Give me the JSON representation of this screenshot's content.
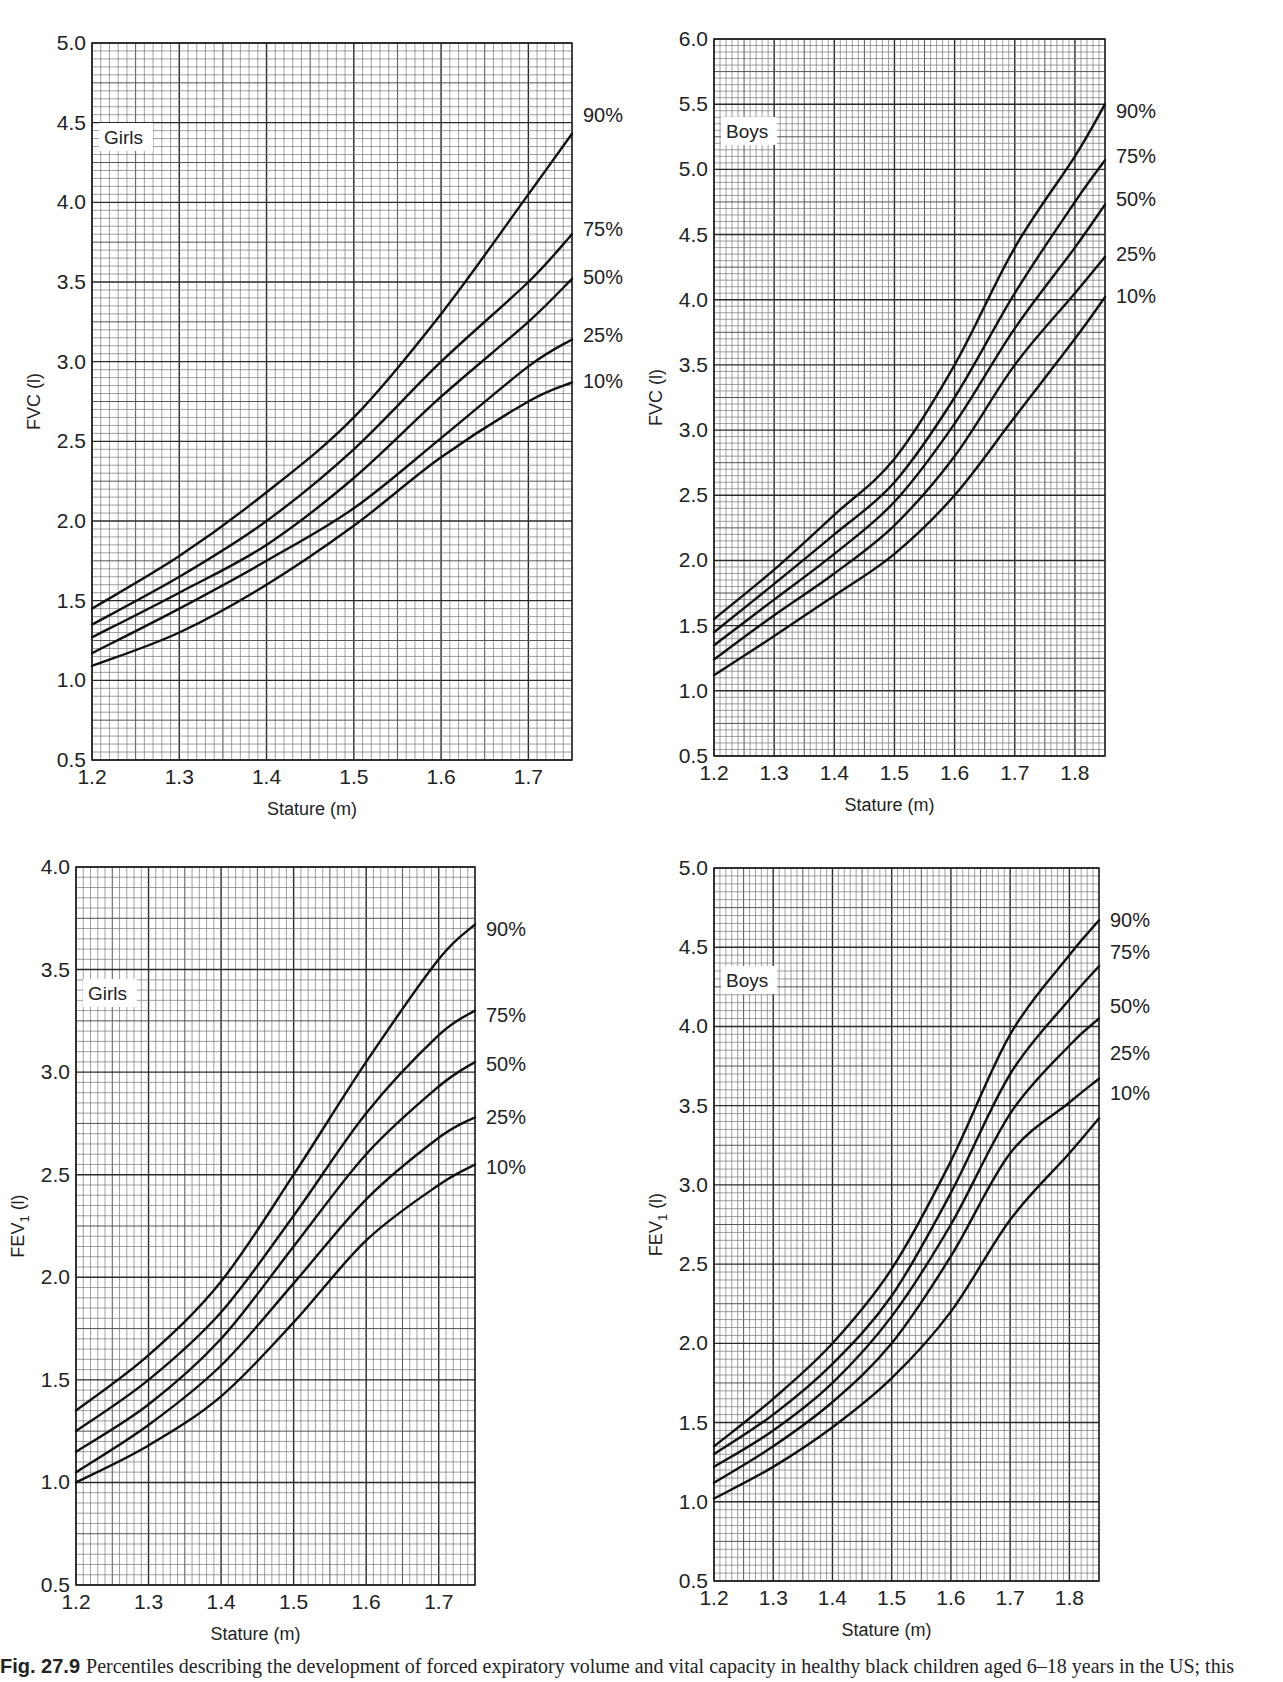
{
  "caption": {
    "fig_label": "Fig. 27.9",
    "text": "Percentiles describing the development of forced expiratory volume and vital capacity in healthy black children aged 6–18 years in the US; this"
  },
  "chart_data": [
    {
      "id": "girls-fvc",
      "type": "line",
      "panel_label": "Girls",
      "title": "",
      "xlabel": "Stature (m)",
      "ylabel": "FVC (l)",
      "xlim": [
        1.2,
        1.75
      ],
      "ylim": [
        0.5,
        5.0
      ],
      "xticks": [
        "1.2",
        "1.3",
        "1.4",
        "1.5",
        "1.6",
        "1.7"
      ],
      "yticks": [
        "0.5",
        "1.0",
        "1.5",
        "2.0",
        "2.5",
        "3.0",
        "3.5",
        "4.0",
        "4.5",
        "5.0"
      ],
      "grid": true,
      "legend_position": "right-edge labels",
      "x": [
        1.2,
        1.3,
        1.4,
        1.5,
        1.6,
        1.7,
        1.75
      ],
      "series": [
        {
          "name": "90%",
          "values": [
            1.45,
            1.78,
            2.18,
            2.65,
            3.3,
            4.05,
            4.43
          ],
          "label_y": 4.55
        },
        {
          "name": "75%",
          "values": [
            1.35,
            1.65,
            2.0,
            2.45,
            3.0,
            3.5,
            3.8
          ],
          "label_y": 3.83
        },
        {
          "name": "50%",
          "values": [
            1.27,
            1.55,
            1.85,
            2.27,
            2.78,
            3.25,
            3.52
          ],
          "label_y": 3.53
        },
        {
          "name": "25%",
          "values": [
            1.17,
            1.45,
            1.75,
            2.08,
            2.52,
            2.97,
            3.14
          ],
          "label_y": 3.17
        },
        {
          "name": "10%",
          "values": [
            1.09,
            1.3,
            1.6,
            1.97,
            2.4,
            2.75,
            2.87
          ],
          "label_y": 2.88
        }
      ]
    },
    {
      "id": "boys-fvc",
      "type": "line",
      "panel_label": "Boys",
      "title": "",
      "xlabel": "Stature (m)",
      "ylabel": "FVC (l)",
      "xlim": [
        1.2,
        1.85
      ],
      "ylim": [
        0.5,
        6.0
      ],
      "xticks": [
        "1.2",
        "1.3",
        "1.4",
        "1.5",
        "1.6",
        "1.7",
        "1.8"
      ],
      "yticks": [
        "0.5",
        "1.0",
        "1.5",
        "2.0",
        "2.5",
        "3.0",
        "3.5",
        "4.0",
        "4.5",
        "5.0",
        "5.5",
        "6.0"
      ],
      "grid": true,
      "legend_position": "right-edge labels",
      "x": [
        1.2,
        1.3,
        1.4,
        1.5,
        1.6,
        1.7,
        1.8,
        1.85
      ],
      "series": [
        {
          "name": "90%",
          "values": [
            1.55,
            1.93,
            2.35,
            2.78,
            3.5,
            4.4,
            5.1,
            5.5
          ],
          "label_y": 5.45
        },
        {
          "name": "75%",
          "values": [
            1.45,
            1.82,
            2.2,
            2.6,
            3.25,
            4.05,
            4.75,
            5.07
          ],
          "label_y": 5.1
        },
        {
          "name": "50%",
          "values": [
            1.35,
            1.7,
            2.05,
            2.45,
            3.05,
            3.78,
            4.4,
            4.73
          ],
          "label_y": 4.77
        },
        {
          "name": "25%",
          "values": [
            1.24,
            1.58,
            1.9,
            2.27,
            2.8,
            3.5,
            4.05,
            4.33
          ],
          "label_y": 4.35
        },
        {
          "name": "10%",
          "values": [
            1.12,
            1.42,
            1.73,
            2.05,
            2.5,
            3.1,
            3.7,
            4.02
          ],
          "label_y": 4.03
        }
      ]
    },
    {
      "id": "girls-fev1",
      "type": "line",
      "panel_label": "Girls",
      "title": "",
      "xlabel": "Stature (m)",
      "ylabel": "FEV1 (l)",
      "xlim": [
        1.2,
        1.75
      ],
      "ylim": [
        0.5,
        4.0
      ],
      "xticks": [
        "1.2",
        "1.3",
        "1.4",
        "1.5",
        "1.6",
        "1.7"
      ],
      "yticks": [
        "0.5",
        "1.0",
        "1.5",
        "2.0",
        "2.5",
        "3.0",
        "3.5",
        "4.0"
      ],
      "grid": true,
      "legend_position": "right-edge labels",
      "x": [
        1.2,
        1.3,
        1.4,
        1.5,
        1.6,
        1.7,
        1.75
      ],
      "series": [
        {
          "name": "90%",
          "values": [
            1.35,
            1.62,
            1.98,
            2.5,
            3.05,
            3.55,
            3.72
          ],
          "label_y": 3.7
        },
        {
          "name": "75%",
          "values": [
            1.25,
            1.5,
            1.83,
            2.3,
            2.8,
            3.18,
            3.3
          ],
          "label_y": 3.28
        },
        {
          "name": "50%",
          "values": [
            1.15,
            1.38,
            1.7,
            2.15,
            2.6,
            2.93,
            3.05
          ],
          "label_y": 3.04
        },
        {
          "name": "25%",
          "values": [
            1.05,
            1.28,
            1.57,
            1.97,
            2.38,
            2.68,
            2.78
          ],
          "label_y": 2.78
        },
        {
          "name": "10%",
          "values": [
            1.0,
            1.18,
            1.42,
            1.78,
            2.18,
            2.45,
            2.55
          ],
          "label_y": 2.54
        }
      ]
    },
    {
      "id": "boys-fev1",
      "type": "line",
      "panel_label": "Boys",
      "title": "",
      "xlabel": "Stature (m)",
      "ylabel": "FEV1 (l)",
      "xlim": [
        1.2,
        1.85
      ],
      "ylim": [
        0.5,
        5.0
      ],
      "xticks": [
        "1.2",
        "1.3",
        "1.4",
        "1.5",
        "1.6",
        "1.7",
        "1.8"
      ],
      "yticks": [
        "0.5",
        "1.0",
        "1.5",
        "2.0",
        "2.5",
        "3.0",
        "3.5",
        "4.0",
        "4.5",
        "5.0"
      ],
      "grid": true,
      "legend_position": "right-edge labels",
      "x": [
        1.2,
        1.3,
        1.4,
        1.5,
        1.6,
        1.7,
        1.8,
        1.85
      ],
      "series": [
        {
          "name": "90%",
          "values": [
            1.35,
            1.65,
            2.0,
            2.47,
            3.15,
            3.95,
            4.45,
            4.67
          ],
          "label_y": 4.67
        },
        {
          "name": "75%",
          "values": [
            1.3,
            1.55,
            1.87,
            2.3,
            2.95,
            3.7,
            4.17,
            4.38
          ],
          "label_y": 4.47
        },
        {
          "name": "50%",
          "values": [
            1.22,
            1.45,
            1.75,
            2.17,
            2.75,
            3.45,
            3.88,
            4.05
          ],
          "label_y": 4.13
        },
        {
          "name": "25%",
          "values": [
            1.12,
            1.35,
            1.63,
            2.0,
            2.55,
            3.2,
            3.52,
            3.67
          ],
          "label_y": 3.83
        },
        {
          "name": "10%",
          "values": [
            1.02,
            1.22,
            1.47,
            1.78,
            2.2,
            2.78,
            3.2,
            3.42
          ],
          "label_y": 3.58
        }
      ]
    }
  ],
  "layout": {
    "panels": [
      {
        "left": 92,
        "top": 43,
        "right": 572,
        "bottom": 760,
        "panel_label_y_px": 137
      },
      {
        "left": 714,
        "top": 39,
        "right": 1105,
        "bottom": 756,
        "panel_label_y_px": 131
      },
      {
        "left": 76,
        "top": 867,
        "right": 475,
        "bottom": 1585,
        "panel_label_y_px": 993
      },
      {
        "left": 714,
        "top": 868,
        "right": 1099,
        "bottom": 1581,
        "panel_label_y_px": 980
      }
    ]
  }
}
